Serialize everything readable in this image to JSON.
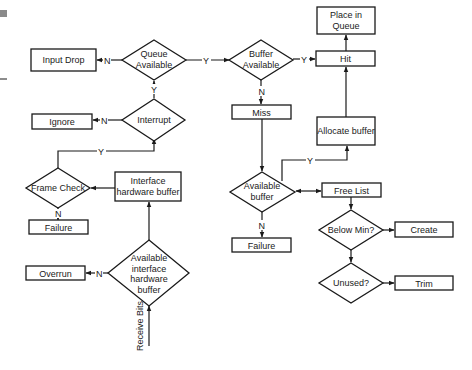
{
  "diagram": {
    "type": "flowchart",
    "colors": {
      "line": "#1a1a1a",
      "fill": "#ffffff",
      "artifact": "#8a8a8a"
    },
    "nodes": {
      "input_drop": {
        "shape": "rect",
        "lines": [
          "Input Drop"
        ]
      },
      "queue_available": {
        "shape": "diamond",
        "lines": [
          "Queue",
          "Available"
        ]
      },
      "buffer_available": {
        "shape": "diamond",
        "lines": [
          "Buffer",
          "Available"
        ]
      },
      "place_in_queue": {
        "shape": "rect",
        "lines": [
          "Place in",
          "Queue"
        ]
      },
      "hit": {
        "shape": "rect",
        "lines": [
          "Hit"
        ]
      },
      "ignore": {
        "shape": "rect",
        "lines": [
          "Ignore"
        ]
      },
      "interrupt": {
        "shape": "diamond",
        "lines": [
          "Interrupt"
        ]
      },
      "miss": {
        "shape": "rect",
        "lines": [
          "Miss"
        ]
      },
      "allocate_buffer": {
        "shape": "rect",
        "lines": [
          "Allocate buffer"
        ]
      },
      "frame_check": {
        "shape": "diamond",
        "lines": [
          "Frame Check"
        ]
      },
      "interface_hw_buffer": {
        "shape": "rect",
        "lines": [
          "Interface",
          "hardware buffer"
        ]
      },
      "available_buffer": {
        "shape": "diamond",
        "lines": [
          "Available",
          "buffer"
        ]
      },
      "free_list": {
        "shape": "rect",
        "lines": [
          "Free List"
        ]
      },
      "failure_left": {
        "shape": "rect",
        "lines": [
          "Failure"
        ]
      },
      "failure_right": {
        "shape": "rect",
        "lines": [
          "Failure"
        ]
      },
      "below_min": {
        "shape": "diamond",
        "lines": [
          "Below Min?"
        ]
      },
      "create": {
        "shape": "rect",
        "lines": [
          "Create"
        ]
      },
      "overrun": {
        "shape": "rect",
        "lines": [
          "Overrun"
        ]
      },
      "available_iface_hw_buffer": {
        "shape": "diamond",
        "lines": [
          "Available",
          "interface",
          "hardware",
          "buffer"
        ]
      },
      "unused": {
        "shape": "diamond",
        "lines": [
          "Unused?"
        ]
      },
      "trim": {
        "shape": "rect",
        "lines": [
          "Trim"
        ]
      }
    },
    "edge_labels": {
      "yes": "Y",
      "no": "N",
      "receive_bits": "Receive Bits"
    },
    "edges": [
      {
        "from": "receive_bits",
        "to": "available_iface_hw_buffer",
        "label": ""
      },
      {
        "from": "available_iface_hw_buffer",
        "to": "overrun",
        "label": "N"
      },
      {
        "from": "available_iface_hw_buffer",
        "to": "interface_hw_buffer",
        "label": "Y"
      },
      {
        "from": "interface_hw_buffer",
        "to": "frame_check",
        "label": ""
      },
      {
        "from": "frame_check",
        "to": "failure_left",
        "label": "N"
      },
      {
        "from": "frame_check",
        "to": "interrupt",
        "label": "Y"
      },
      {
        "from": "interrupt",
        "to": "ignore",
        "label": "N"
      },
      {
        "from": "interrupt",
        "to": "queue_available",
        "label": "Y"
      },
      {
        "from": "queue_available",
        "to": "input_drop",
        "label": "N"
      },
      {
        "from": "queue_available",
        "to": "buffer_available",
        "label": "Y"
      },
      {
        "from": "buffer_available",
        "to": "hit",
        "label": "Y"
      },
      {
        "from": "buffer_available",
        "to": "miss",
        "label": "N"
      },
      {
        "from": "hit",
        "to": "place_in_queue",
        "label": ""
      },
      {
        "from": "miss",
        "to": "available_buffer",
        "label": ""
      },
      {
        "from": "available_buffer",
        "to": "allocate_buffer",
        "label": "Y"
      },
      {
        "from": "available_buffer",
        "to": "failure_right",
        "label": "N"
      },
      {
        "from": "available_buffer",
        "to": "free_list",
        "label": "bidirectional"
      },
      {
        "from": "allocate_buffer",
        "to": "hit",
        "label": ""
      },
      {
        "from": "free_list",
        "to": "below_min",
        "label": ""
      },
      {
        "from": "below_min",
        "to": "create",
        "label": ""
      },
      {
        "from": "below_min",
        "to": "unused",
        "label": ""
      },
      {
        "from": "unused",
        "to": "trim",
        "label": ""
      }
    ]
  }
}
